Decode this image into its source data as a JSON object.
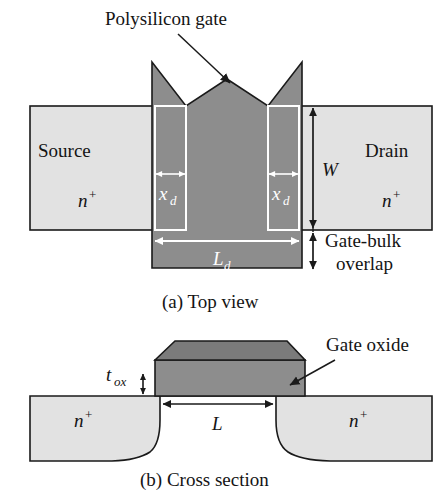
{
  "figure": {
    "colors": {
      "gate_fill": "#8d8d8d",
      "gate_top_fill": "#7b7b7b",
      "diffusion_fill": "#e2e2e2",
      "outline": "#1a1a1a",
      "white_annotation": "#ffffff",
      "background": "#ffffff",
      "text": "#141414"
    }
  },
  "callouts": {
    "polysilicon_gate": "Polysilicon gate",
    "gate_oxide": "Gate oxide",
    "gate_bulk_overlap_line1": "Gate-bulk",
    "gate_bulk_overlap_line2": "overlap"
  },
  "top_view": {
    "caption": "(a) Top view",
    "source_label": "Source",
    "source_doping": "n",
    "source_doping_sup": "+",
    "drain_label": "Drain",
    "drain_doping": "n",
    "drain_doping_sup": "+",
    "width_symbol": "W",
    "gate_length_symbol": "L",
    "gate_length_sub": "d",
    "xd_left_symbol": "x",
    "xd_left_sub": "d",
    "xd_right_symbol": "x",
    "xd_right_sub": "d"
  },
  "cross_section": {
    "caption": "(b) Cross section",
    "oxide_thickness_symbol": "t",
    "oxide_thickness_sub": "ox",
    "channel_length_symbol": "L",
    "left_doping": "n",
    "left_doping_sup": "+",
    "right_doping": "n",
    "right_doping_sup": "+"
  }
}
